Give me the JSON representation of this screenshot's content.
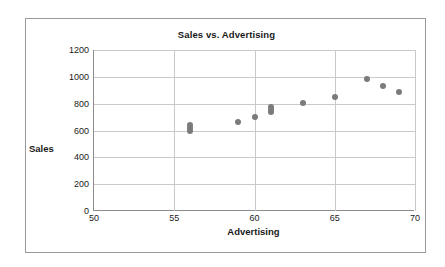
{
  "chart_data": {
    "type": "scatter",
    "title": "Sales vs. Advertising",
    "xlabel": "Advertising",
    "ylabel": "Sales",
    "xlim": [
      50,
      70
    ],
    "ylim": [
      0,
      1200
    ],
    "xticks": [
      50,
      55,
      60,
      65,
      70
    ],
    "yticks": [
      0,
      200,
      400,
      600,
      800,
      1000,
      1200
    ],
    "grid": true,
    "legend": null,
    "marker_color": "#7b7b7b",
    "points": [
      {
        "x": 56,
        "y": 600
      },
      {
        "x": 56,
        "y": 620
      },
      {
        "x": 56,
        "y": 640
      },
      {
        "x": 59,
        "y": 665
      },
      {
        "x": 60,
        "y": 700
      },
      {
        "x": 61,
        "y": 735
      },
      {
        "x": 61,
        "y": 750
      },
      {
        "x": 61,
        "y": 772
      },
      {
        "x": 63,
        "y": 805
      },
      {
        "x": 65,
        "y": 848
      },
      {
        "x": 67,
        "y": 985
      },
      {
        "x": 68,
        "y": 935
      },
      {
        "x": 69,
        "y": 890
      }
    ]
  }
}
